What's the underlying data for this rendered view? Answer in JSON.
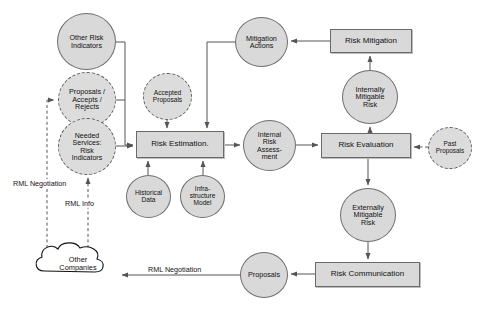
{
  "diagram": {
    "colors": {
      "node_fill": "#d9d9d9",
      "node_stroke": "#6e6e6e",
      "dashed_stroke": "#5a5a5a",
      "line": "#555555",
      "text": "#111111",
      "background": "#ffffff"
    },
    "nodes": [
      {
        "id": "other_risk_indicators",
        "label": "Other Risk\nIndicators",
        "shape": "circle",
        "style": "solid",
        "x": 57,
        "y": 13,
        "w": 59,
        "h": 57,
        "font": 7.2
      },
      {
        "id": "proposals_accepts_rejects",
        "label": "Proposals /\nAccepts /\nRejects",
        "shape": "circle",
        "style": "dashed",
        "x": 58,
        "y": 72,
        "w": 58,
        "h": 55,
        "font": 7.2
      },
      {
        "id": "needed_services_risk_indicators",
        "label": "Needed\nServices:\nRisk\nIndicators",
        "shape": "circle",
        "style": "dashed",
        "x": 58,
        "y": 118,
        "w": 58,
        "h": 57,
        "font": 7.0
      },
      {
        "id": "accepted_proposals",
        "label": "Accepted\nProposals",
        "shape": "circle",
        "style": "dashed",
        "x": 143,
        "y": 73,
        "w": 49,
        "h": 47,
        "font": 6.6
      },
      {
        "id": "risk_estimation",
        "label": "Risk Estimation.",
        "shape": "rect",
        "style": "solid",
        "x": 136,
        "y": 131,
        "w": 88,
        "h": 27,
        "font": 8.0
      },
      {
        "id": "historical_data",
        "label": "Historical\nData",
        "shape": "circle",
        "style": "solid",
        "x": 126,
        "y": 175,
        "w": 45,
        "h": 43,
        "font": 6.6
      },
      {
        "id": "infrastructure_model",
        "label": "Infra-\nstructure\nModel",
        "shape": "circle",
        "style": "solid",
        "x": 180,
        "y": 175,
        "w": 45,
        "h": 43,
        "font": 6.6
      },
      {
        "id": "internal_risk_assessment",
        "label": "Internal\nRisk\nAssess-\nment",
        "shape": "circle",
        "style": "solid",
        "x": 243,
        "y": 120,
        "w": 53,
        "h": 51,
        "font": 7.0
      },
      {
        "id": "mitigation_actions",
        "label": "Mitigation\nActions",
        "shape": "circle",
        "style": "solid",
        "x": 235,
        "y": 17,
        "w": 53,
        "h": 50,
        "font": 7.2
      },
      {
        "id": "risk_mitigation",
        "label": "Risk Mitigation",
        "shape": "rect",
        "style": "solid",
        "x": 330,
        "y": 29,
        "w": 82,
        "h": 24,
        "font": 8.0
      },
      {
        "id": "internally_mitigable_risk",
        "label": "Internally\nMitigable\nRisk",
        "shape": "circle",
        "style": "solid",
        "x": 342,
        "y": 70,
        "w": 56,
        "h": 54,
        "font": 7.2
      },
      {
        "id": "risk_evaluation",
        "label": "Risk Evaluation",
        "shape": "rect",
        "style": "solid",
        "x": 321,
        "y": 133,
        "w": 90,
        "h": 25,
        "font": 8.0
      },
      {
        "id": "past_proposals",
        "label": "Past\nProposals",
        "shape": "circle",
        "style": "dashed",
        "x": 428,
        "y": 127,
        "w": 44,
        "h": 42,
        "font": 6.4
      },
      {
        "id": "externally_mitigable_risk",
        "label": "Externally\nMitigable\nRisk",
        "shape": "circle",
        "style": "solid",
        "x": 340,
        "y": 188,
        "w": 56,
        "h": 54,
        "font": 7.2
      },
      {
        "id": "risk_communication",
        "label": "Risk Communication",
        "shape": "rect",
        "style": "solid",
        "x": 315,
        "y": 262,
        "w": 105,
        "h": 25,
        "font": 8.0
      },
      {
        "id": "proposals",
        "label": "Proposals",
        "shape": "circle",
        "style": "solid",
        "x": 240,
        "y": 252,
        "w": 48,
        "h": 46,
        "font": 7.2
      },
      {
        "id": "other_companies",
        "label": "Other\nCompanies",
        "shape": "cloud",
        "style": "solid",
        "x": 36,
        "y": 248,
        "w": 84,
        "h": 42,
        "font": 7.4
      }
    ],
    "edge_labels": [
      {
        "id": "rml_negotiation_left",
        "text": "RML Negotiation",
        "x": 12,
        "y": 179,
        "font": 7.2
      },
      {
        "id": "rml_info",
        "text": "RML Info",
        "x": 64,
        "y": 199,
        "font": 7.2
      },
      {
        "id": "rml_negotiation_bottom",
        "text": "RML Negotiation",
        "x": 147,
        "y": 265,
        "font": 7.2
      }
    ],
    "edges": [
      {
        "from": "other_risk_indicators",
        "to": "risk_estimation",
        "type": "solid"
      },
      {
        "from": "proposals_accepts_rejects",
        "to": "risk_estimation",
        "type": "solid"
      },
      {
        "from": "needed_services_risk_indicators",
        "to": "risk_estimation",
        "type": "solid"
      },
      {
        "from": "accepted_proposals",
        "to": "risk_estimation",
        "type": "dashed"
      },
      {
        "from": "historical_data",
        "to": "risk_estimation",
        "type": "solid"
      },
      {
        "from": "infrastructure_model",
        "to": "risk_estimation",
        "type": "solid"
      },
      {
        "from": "mitigation_actions",
        "to": "risk_estimation",
        "type": "solid"
      },
      {
        "from": "risk_estimation",
        "to": "internal_risk_assessment",
        "type": "solid"
      },
      {
        "from": "internal_risk_assessment",
        "to": "risk_evaluation",
        "type": "solid"
      },
      {
        "from": "past_proposals",
        "to": "risk_evaluation",
        "type": "dashed"
      },
      {
        "from": "risk_evaluation",
        "to": "internally_mitigable_risk",
        "type": "solid"
      },
      {
        "from": "internally_mitigable_risk",
        "to": "risk_mitigation",
        "type": "solid"
      },
      {
        "from": "risk_mitigation",
        "to": "mitigation_actions",
        "type": "solid"
      },
      {
        "from": "risk_evaluation",
        "to": "externally_mitigable_risk",
        "type": "solid"
      },
      {
        "from": "externally_mitigable_risk",
        "to": "risk_communication",
        "type": "solid"
      },
      {
        "from": "risk_communication",
        "to": "proposals",
        "type": "solid"
      },
      {
        "from": "proposals",
        "to": "other_companies",
        "type": "solid",
        "label": "RML Negotiation"
      },
      {
        "from": "other_companies",
        "to": "proposals_accepts_rejects",
        "type": "dashed",
        "label": "RML Negotiation"
      },
      {
        "from": "other_companies",
        "to": "needed_services_risk_indicators",
        "type": "dashed",
        "label": "RML Info"
      }
    ]
  }
}
